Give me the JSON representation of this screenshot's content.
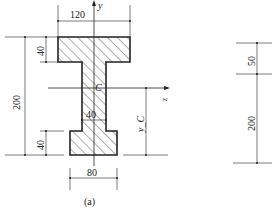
{
  "figure": {
    "caption": "(a)",
    "section": "I-shaped cross-section",
    "dimensions": {
      "top_width": "120",
      "top_flange_height": "40",
      "total_height": "200",
      "web_width": "40",
      "bottom_flange_height": "40",
      "bottom_width": "80"
    },
    "axes": {
      "y_label": "y",
      "z_label": "z",
      "centroid_label": "C",
      "centroid_distance_label": "y_C"
    },
    "right_figure": {
      "upper_dim": "50",
      "lower_dim": "200"
    }
  },
  "colors": {
    "stroke": "#222222",
    "hatch": "#333333",
    "background": "#ffffff"
  }
}
